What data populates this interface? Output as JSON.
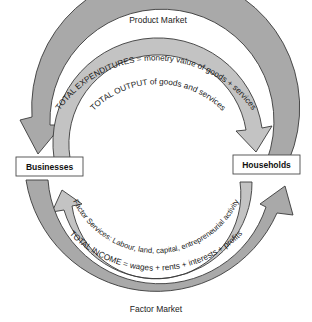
{
  "diagram": {
    "type": "circular-flow",
    "markets": {
      "top": "Product Market",
      "bottom": "Factor Market"
    },
    "nodes": {
      "left": "Businesses",
      "right": "Households"
    },
    "flows": [
      {
        "id": "total-expenditures",
        "label": "TOTAL EXPENDITURES = monetry value of goods + services",
        "ring": "outer",
        "side": "top",
        "from": "Households",
        "to": "Businesses",
        "color": "#a9a9a9"
      },
      {
        "id": "total-output",
        "label": "TOTAL OUTPUT of goods and services",
        "ring": "inner",
        "side": "top",
        "from": "Businesses",
        "to": "Households",
        "color": "#c3c3c3"
      },
      {
        "id": "factor-services",
        "label": "Factor Services: Labour, land, capital, entrepreneurial activity",
        "ring": "inner",
        "side": "bottom",
        "from": "Households",
        "to": "Businesses",
        "color": "#c3c3c3"
      },
      {
        "id": "total-income",
        "label": "TOTAL INCOME = wages + rents + interests + profits",
        "ring": "outer",
        "side": "bottom",
        "from": "Businesses",
        "to": "Households",
        "color": "#a9a9a9"
      }
    ]
  }
}
